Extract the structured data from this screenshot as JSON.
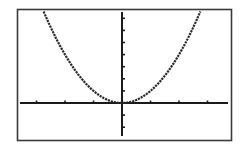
{
  "chart_data": {
    "type": "line",
    "title": "",
    "xlabel": "",
    "ylabel": "",
    "function": "y = x^2",
    "xlim": [
      -3.5,
      3.5
    ],
    "ylim": [
      -2.75,
      7.5
    ],
    "xscl": 1,
    "yscl": 1,
    "grid": false,
    "legend": null,
    "series": [
      {
        "name": "y = x^2",
        "x": [
          -2.75,
          -2.5,
          -2.25,
          -2,
          -1.75,
          -1.5,
          -1.25,
          -1,
          -0.75,
          -0.5,
          -0.25,
          0,
          0.25,
          0.5,
          0.75,
          1,
          1.25,
          1.5,
          1.75,
          2,
          2.25,
          2.5,
          2.75
        ],
        "y": [
          7.5625,
          6.25,
          5.0625,
          4,
          3.0625,
          2.25,
          1.5625,
          1,
          0.5625,
          0.25,
          0.0625,
          0,
          0.0625,
          0.25,
          0.5625,
          1,
          1.5625,
          2.25,
          3.0625,
          4,
          5.0625,
          6.25,
          7.5625
        ]
      }
    ],
    "x_ticks": [
      -3,
      -2,
      -1,
      1,
      2,
      3
    ],
    "y_ticks": [
      -2,
      -1,
      1,
      2,
      3,
      4,
      5,
      6,
      7
    ]
  },
  "colors": {
    "background": "#ffffff",
    "frame": "#3a3a3a",
    "axes": "#1a1a1a",
    "curve": "#2a2a2a"
  }
}
